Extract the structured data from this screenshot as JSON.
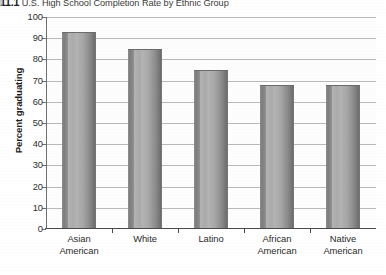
{
  "figure": {
    "number": "11.1",
    "title": "U.S. High School Completion Rate by Ethnic Group"
  },
  "chart_data": {
    "type": "bar",
    "title": "U.S. High School Completion Rate by Ethnic Group",
    "xlabel": "",
    "ylabel": "Percent graduating",
    "ylim": [
      0,
      100
    ],
    "ytick_step": 10,
    "yticks": [
      0,
      10,
      20,
      30,
      40,
      50,
      60,
      70,
      80,
      90,
      100
    ],
    "ytick_labels": [
      "0",
      "10",
      "20",
      "30",
      "40",
      "50",
      "60",
      "70",
      "80",
      "90",
      "100"
    ],
    "grid": true,
    "legend": "none",
    "categories": [
      "Asian American",
      "White",
      "Latino",
      "African American",
      "Native American"
    ],
    "category_lines": [
      [
        "Asian",
        "American"
      ],
      [
        "White",
        ""
      ],
      [
        "Latino",
        ""
      ],
      [
        "African",
        "American"
      ],
      [
        "Native",
        "American"
      ]
    ],
    "values": [
      93,
      85,
      75,
      68,
      68
    ],
    "bar_color": "#9a9a9a",
    "bar_style": "3d-cylinder-gradient",
    "axis_color": "#4a4a4a",
    "gridline_color": "#b9b9b9"
  }
}
